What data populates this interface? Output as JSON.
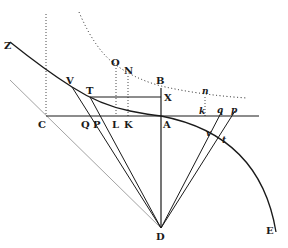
{
  "figure": {
    "type": "geometric-construction",
    "colors": {
      "ink": "#1a1a1a",
      "faint": "#8a8a8a",
      "background": "#ffffff"
    },
    "labels": {
      "Z": "Z",
      "V": "V",
      "T": "T",
      "O": "O",
      "N": "N",
      "B": "B",
      "X": "X",
      "C": "C",
      "Q": "Q",
      "P": "P",
      "L": "L",
      "K": "K",
      "A": "A",
      "n": "n",
      "k": "k",
      "q": "q",
      "p": "p",
      "v": "v",
      "t": "t",
      "D": "D",
      "E": "E"
    }
  }
}
